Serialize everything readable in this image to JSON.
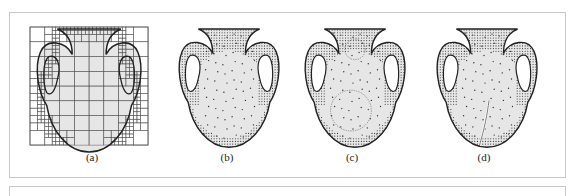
{
  "figure": {
    "panels": [
      {
        "id": "a",
        "caption": "(a)",
        "style": "quadtree-grid"
      },
      {
        "id": "b",
        "caption": "(b)",
        "style": "point-sampling"
      },
      {
        "id": "c",
        "caption": "(c)",
        "style": "point-sampling-with-circles"
      },
      {
        "id": "d",
        "caption": "(d)",
        "style": "point-sampling-cracked"
      }
    ]
  },
  "colors": {
    "frame_border": "#c8c8c8",
    "vase_fill": "#e6e6e6",
    "outline": "#222222",
    "points": "#333333",
    "grid": "#555555"
  }
}
